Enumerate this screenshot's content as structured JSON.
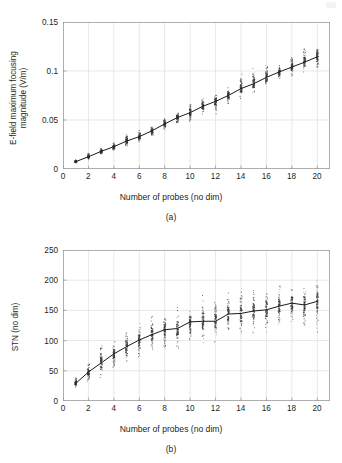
{
  "figure": {
    "panels": [
      {
        "id": "a",
        "panel_label": "(a)",
        "xlabel": "Number of probes (no dim)",
        "ylabel_line1": "E-field maximum focusing",
        "ylabel_line2": "magnitude (V/m)",
        "yticks": [
          "0",
          "0.05",
          "0.1",
          "0.15"
        ],
        "xticks": [
          "0",
          "2",
          "4",
          "6",
          "8",
          "10",
          "12",
          "14",
          "16",
          "18",
          "20"
        ]
      },
      {
        "id": "b",
        "panel_label": "(b)",
        "xlabel": "Number of probes (no dim)",
        "ylabel_line1": "STN (no dim)",
        "ylabel_line2": "",
        "yticks": [
          "0",
          "50",
          "100",
          "150",
          "200",
          "250"
        ],
        "xticks": [
          "0",
          "2",
          "4",
          "6",
          "8",
          "10",
          "12",
          "14",
          "16",
          "18",
          "20"
        ]
      }
    ]
  },
  "colors": {
    "ink": "#231f20",
    "axis": "#9a9a9a",
    "grid": "#d8d8d8",
    "marker": "#3a3a3a",
    "meanline": "#1a1a1a",
    "background": "#ffffff"
  },
  "chart_data": [
    {
      "type": "scatter",
      "id": "a",
      "title": "",
      "xlabel": "Number of probes (no dim)",
      "ylabel": "E-field maximum focusing magnitude (V/m)",
      "xlim": [
        0,
        21
      ],
      "ylim": [
        0,
        0.15
      ],
      "xticks": [
        0,
        2,
        4,
        6,
        8,
        10,
        12,
        14,
        16,
        18,
        20
      ],
      "yticks": [
        0,
        0.05,
        0.1,
        0.15
      ],
      "grid": true,
      "legend": "none",
      "x": [
        1,
        2,
        3,
        4,
        5,
        6,
        7,
        8,
        9,
        10,
        11,
        12,
        13,
        14,
        15,
        16,
        17,
        18,
        19,
        20
      ],
      "series": [
        {
          "name": "mean",
          "kind": "line",
          "values": [
            0.0075,
            0.0125,
            0.018,
            0.0228,
            0.0285,
            0.033,
            0.039,
            0.046,
            0.0525,
            0.0575,
            0.064,
            0.069,
            0.075,
            0.082,
            0.087,
            0.0935,
            0.099,
            0.104,
            0.109,
            0.1145
          ]
        },
        {
          "name": "spread_low",
          "kind": "scatter_min",
          "values": [
            0.0055,
            0.009,
            0.014,
            0.018,
            0.0225,
            0.027,
            0.033,
            0.0395,
            0.045,
            0.048,
            0.053,
            0.055,
            0.065,
            0.072,
            0.0745,
            0.081,
            0.0905,
            0.093,
            0.096,
            0.0975
          ]
        },
        {
          "name": "spread_high",
          "kind": "scatter_max",
          "values": [
            0.01,
            0.0165,
            0.0225,
            0.029,
            0.0375,
            0.04,
            0.0455,
            0.053,
            0.059,
            0.07,
            0.072,
            0.079,
            0.083,
            0.101,
            0.103,
            0.109,
            0.106,
            0.12,
            0.1255,
            0.129
          ]
        }
      ]
    },
    {
      "type": "scatter",
      "id": "b",
      "title": "",
      "xlabel": "Number of probes (no dim)",
      "ylabel": "STN (no dim)",
      "xlim": [
        0,
        21
      ],
      "ylim": [
        0,
        250
      ],
      "xticks": [
        0,
        2,
        4,
        6,
        8,
        10,
        12,
        14,
        16,
        18,
        20
      ],
      "yticks": [
        0,
        50,
        100,
        150,
        200,
        250
      ],
      "grid": true,
      "legend": "none",
      "x": [
        1,
        2,
        3,
        4,
        5,
        6,
        7,
        8,
        9,
        10,
        11,
        12,
        13,
        14,
        15,
        16,
        17,
        18,
        19,
        20
      ],
      "series": [
        {
          "name": "mean",
          "kind": "line",
          "values": [
            29,
            48,
            63,
            78,
            90,
            101,
            110,
            118,
            120,
            131,
            132,
            132,
            144,
            145,
            149,
            151,
            157,
            162,
            159,
            165
          ]
        },
        {
          "name": "spread_low",
          "kind": "scatter_min",
          "values": [
            21,
            30,
            38,
            45,
            57,
            62,
            73,
            82,
            80,
            92,
            86,
            95,
            103,
            104,
            106,
            110,
            112,
            120,
            105,
            103
          ]
        },
        {
          "name": "spread_high",
          "kind": "scatter_max",
          "values": [
            41,
            62,
            99,
            98,
            122,
            128,
            143,
            152,
            157,
            150,
            178,
            172,
            184,
            196,
            193,
            195,
            190,
            196,
            192,
            199
          ]
        }
      ]
    }
  ]
}
